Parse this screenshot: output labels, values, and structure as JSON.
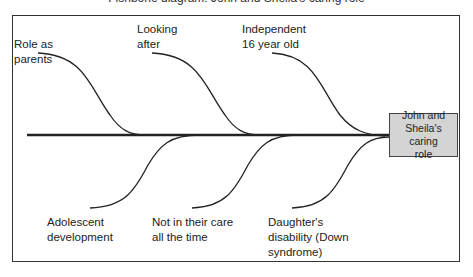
{
  "title": "Fishbone diagram: John and Sheila's caring role",
  "effect": {
    "line1": "John and",
    "line2": "Sheila's caring",
    "line3": "role",
    "fill_color": "#d4d4d4"
  },
  "causes_top": [
    {
      "line1": "Role as",
      "line2": "parents"
    },
    {
      "line1": "Looking",
      "line2": "after"
    },
    {
      "line1": "Independent",
      "line2": "16 year old"
    }
  ],
  "causes_bottom": [
    {
      "line1": "Adolescent",
      "line2": "development"
    },
    {
      "line1": "Not in their care",
      "line2": "all the time"
    },
    {
      "line1": "Daughter's",
      "line2": "disability (Down",
      "line3": "syndrome)"
    }
  ]
}
